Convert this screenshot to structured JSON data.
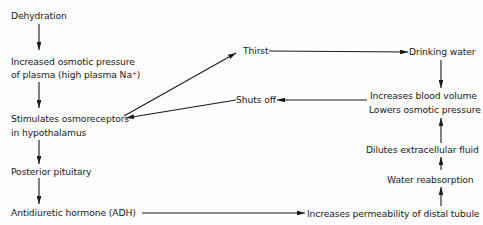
{
  "diagram": {
    "nodes": {
      "dehydration": "Dehydration",
      "osmotic_1": "Increased osmotic pressure",
      "osmotic_2": "of plasma (high plasma Na⁺)",
      "osmo_1": "Stimulates osmoreceptors",
      "osmo_2": "in hypothalamus",
      "pituitary": "Posterior pituitary",
      "adh": "Antidiuretic hormone (ADH)",
      "thirst": "Thirst",
      "drinking": "Drinking water",
      "shuts_off": "Shuts off",
      "blood_volume": "Increases blood volume",
      "lowers_osmotic": "Lowers osmotic pressure",
      "dilutes": "Dilutes extracellular fluid",
      "reabsorption": "Water reabsorption",
      "permeability": "Increases permeability of distal tubule"
    },
    "edges": [
      {
        "from": "Dehydration",
        "to": "Increased osmotic pressure of plasma (high plasma Na⁺)"
      },
      {
        "from": "Increased osmotic pressure of plasma (high plasma Na⁺)",
        "to": "Stimulates osmoreceptors in hypothalamus"
      },
      {
        "from": "Stimulates osmoreceptors in hypothalamus",
        "to": "Thirst"
      },
      {
        "from": "Stimulates osmoreceptors in hypothalamus",
        "to": "Posterior pituitary"
      },
      {
        "from": "Posterior pituitary",
        "to": "Antidiuretic hormone (ADH)"
      },
      {
        "from": "Antidiuretic hormone (ADH)",
        "to": "Increases permeability of distal tubule"
      },
      {
        "from": "Thirst",
        "to": "Drinking water"
      },
      {
        "from": "Drinking water",
        "to": "Increases blood volume / Lowers osmotic pressure"
      },
      {
        "from": "Increases permeability of distal tubule",
        "to": "Water reabsorption"
      },
      {
        "from": "Water reabsorption",
        "to": "Dilutes extracellular fluid"
      },
      {
        "from": "Dilutes extracellular fluid",
        "to": "Increases blood volume / Lowers osmotic pressure"
      },
      {
        "from": "Increases blood volume / Lowers osmotic pressure",
        "to": "Shuts off"
      },
      {
        "from": "Shuts off",
        "to": "Stimulates osmoreceptors in hypothalamus"
      }
    ]
  }
}
